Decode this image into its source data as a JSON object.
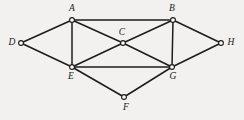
{
  "diagram": {
    "type": "undirected-graph",
    "title": "",
    "background_color": "#f2f1ef",
    "stroke_color": "#1c1c1c",
    "vertex_fill_color": "#fbfbfa",
    "vertex_count": 8,
    "edge_count": 14,
    "vertices": [
      {
        "id": "A",
        "label": "A",
        "x": 72,
        "y": 20,
        "label_x": 72,
        "label_y": 9,
        "label_anchor": "middle"
      },
      {
        "id": "B",
        "label": "B",
        "x": 173,
        "y": 20,
        "label_x": 172,
        "label_y": 9,
        "label_anchor": "middle"
      },
      {
        "id": "C",
        "label": "C",
        "x": 123,
        "y": 43,
        "label_x": 122,
        "label_y": 33,
        "label_anchor": "middle"
      },
      {
        "id": "D",
        "label": "D",
        "x": 21,
        "y": 43,
        "label_x": 12,
        "label_y": 43,
        "label_anchor": "middle"
      },
      {
        "id": "E",
        "label": "E",
        "x": 72,
        "y": 67,
        "label_x": 71,
        "label_y": 77,
        "label_anchor": "middle"
      },
      {
        "id": "F",
        "label": "F",
        "x": 124,
        "y": 97,
        "label_x": 126,
        "label_y": 108,
        "label_anchor": "middle"
      },
      {
        "id": "G",
        "label": "G",
        "x": 172,
        "y": 67,
        "label_x": 173,
        "label_y": 77,
        "label_anchor": "middle"
      },
      {
        "id": "H",
        "label": "H",
        "x": 221,
        "y": 43,
        "label_x": 231,
        "label_y": 43,
        "label_anchor": "middle"
      }
    ],
    "edges": [
      {
        "from": "D",
        "to": "A"
      },
      {
        "from": "D",
        "to": "E"
      },
      {
        "from": "A",
        "to": "B"
      },
      {
        "from": "A",
        "to": "E"
      },
      {
        "from": "A",
        "to": "C"
      },
      {
        "from": "C",
        "to": "G"
      },
      {
        "from": "B",
        "to": "C"
      },
      {
        "from": "C",
        "to": "E"
      },
      {
        "from": "B",
        "to": "G"
      },
      {
        "from": "B",
        "to": "H"
      },
      {
        "from": "G",
        "to": "H"
      },
      {
        "from": "E",
        "to": "G"
      },
      {
        "from": "E",
        "to": "F"
      },
      {
        "from": "F",
        "to": "G"
      }
    ]
  }
}
